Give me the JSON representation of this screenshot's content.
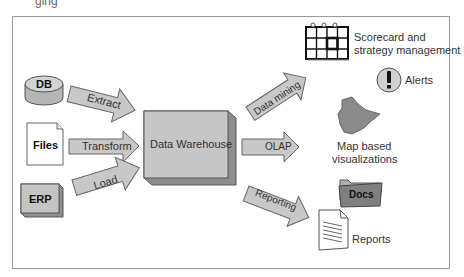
{
  "diagram": {
    "title_fragment": "ging",
    "sources": [
      {
        "id": "db",
        "label": "DB",
        "shape": "cylinder"
      },
      {
        "id": "files",
        "label": "Files",
        "shape": "document"
      },
      {
        "id": "erp",
        "label": "ERP",
        "shape": "box-3d"
      }
    ],
    "etl_arrows": [
      {
        "label": "Extract"
      },
      {
        "label": "Transform"
      },
      {
        "label": "Load"
      }
    ],
    "hub": {
      "label": "Data Warehouse",
      "shape": "box-3d"
    },
    "output_arrows": [
      {
        "label": "Data mining"
      },
      {
        "label": "OLAP"
      },
      {
        "label": "Reporting"
      }
    ],
    "outputs": [
      {
        "id": "scorecard",
        "label_line1": "Scorecard and",
        "label_line2": "strategy management",
        "icon": "calendar-grid-icon"
      },
      {
        "id": "alerts",
        "label": "Alerts",
        "icon": "exclamation-icon"
      },
      {
        "id": "map",
        "label_line1": "Map based",
        "label_line2": "visualizations",
        "icon": "map-icon"
      },
      {
        "id": "docs",
        "label": "Docs",
        "icon": "folder-icon"
      },
      {
        "id": "reports",
        "label": "Reports",
        "icon": "report-document-icon"
      }
    ],
    "colors": {
      "fill": "#c8c8c8",
      "fill_dark": "#8e8e8e",
      "stroke": "#555555",
      "map": "#8a8a8a",
      "folder": "#7f7f7f"
    }
  }
}
